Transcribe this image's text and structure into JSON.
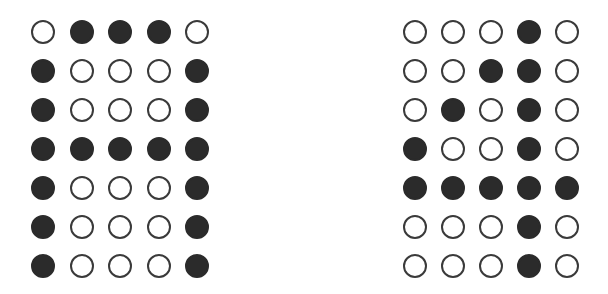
{
  "colors": {
    "filled": "#2b2b2b",
    "outline": "#3a3a3a",
    "background": "#ffffff"
  },
  "grids": [
    {
      "name": "letter-A-dot-matrix",
      "origin": [
        31,
        20
      ],
      "col_step": 38.5,
      "row_step": 39,
      "rows": [
        [
          0,
          1,
          1,
          1,
          0
        ],
        [
          1,
          0,
          0,
          0,
          1
        ],
        [
          1,
          0,
          0,
          0,
          1
        ],
        [
          1,
          1,
          1,
          1,
          1
        ],
        [
          1,
          0,
          0,
          0,
          1
        ],
        [
          1,
          0,
          0,
          0,
          1
        ],
        [
          1,
          0,
          0,
          0,
          1
        ]
      ]
    },
    {
      "name": "digit-4-dot-matrix",
      "origin": [
        403,
        20
      ],
      "col_step": 38,
      "row_step": 39,
      "rows": [
        [
          0,
          0,
          0,
          1,
          0
        ],
        [
          0,
          0,
          1,
          1,
          0
        ],
        [
          0,
          1,
          0,
          1,
          0
        ],
        [
          1,
          0,
          0,
          1,
          0
        ],
        [
          1,
          1,
          1,
          1,
          1
        ],
        [
          0,
          0,
          0,
          1,
          0
        ],
        [
          0,
          0,
          0,
          1,
          0
        ]
      ]
    }
  ]
}
